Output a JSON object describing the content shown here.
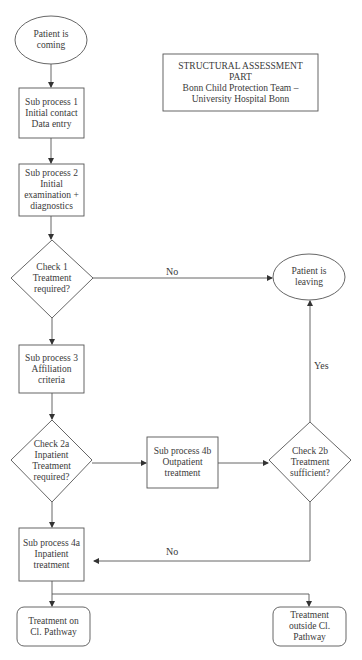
{
  "title_box": {
    "lines": [
      "STRUCTURAL ASSESSMENT",
      "PART",
      "Bonn Child Protection Team –",
      "University Hospital Bonn"
    ]
  },
  "nodes": {
    "start": {
      "shape": "ellipse",
      "lines": [
        "Patient is",
        "coming"
      ]
    },
    "sub1": {
      "shape": "rect",
      "lines": [
        "Sub process 1",
        "Initial contact",
        "Data entry"
      ]
    },
    "sub2": {
      "shape": "rect",
      "lines": [
        "Sub process 2",
        "Initial",
        "examination +",
        "diagnostics"
      ]
    },
    "check1": {
      "shape": "diamond",
      "lines": [
        "Check 1",
        "Treatment",
        "required?"
      ]
    },
    "leaving": {
      "shape": "ellipse",
      "lines": [
        "Patient is",
        "leaving"
      ]
    },
    "sub3": {
      "shape": "rect",
      "lines": [
        "Sub process 3",
        "Affiliation",
        "criteria"
      ]
    },
    "check2a": {
      "shape": "diamond",
      "lines": [
        "Check 2a",
        "Inpatient",
        "Treatment",
        "required?"
      ]
    },
    "sub4b": {
      "shape": "rect",
      "lines": [
        "Sub process 4b",
        "Outpatient",
        "treatment"
      ]
    },
    "check2b": {
      "shape": "diamond",
      "lines": [
        "Check 2b",
        "Treatment",
        "sufficient?"
      ]
    },
    "sub4a": {
      "shape": "rect",
      "lines": [
        "Sub process 4a",
        "Inpatient",
        "treatment"
      ]
    },
    "end_on": {
      "shape": "rounded-rect",
      "lines": [
        "Treatment on",
        "Cl. Pathway"
      ]
    },
    "end_outside": {
      "shape": "rounded-rect",
      "lines": [
        "Treatment",
        "outside Cl.",
        "Pathway"
      ]
    }
  },
  "edges": {
    "check1_no": "No",
    "check2b_yes": "Yes",
    "check2b_no": "No"
  },
  "colors": {
    "stroke": "#555555",
    "text": "#3a3a3a",
    "background": "#ffffff"
  }
}
